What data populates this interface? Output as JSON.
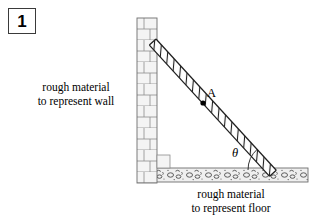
{
  "figure": {
    "number_label": "1",
    "scene": "ladder-against-wall",
    "wall_caption": {
      "line1": "rough material",
      "line2": "to represent wall"
    },
    "floor_caption": {
      "line1": "rough material",
      "line2": "to represent floor"
    },
    "point_label": "A",
    "angle_label": "θ",
    "colors": {
      "ink": "#000000",
      "outline": "#3a3a3a",
      "brick_fill": "#f2f2f2",
      "brick_line": "#8a8a8a",
      "floor_fill": "#ededed",
      "floor_line": "#7a7a7a",
      "ladder_line": "#2b2b2b",
      "background": "#ffffff"
    },
    "geometry": {
      "wall_x": 137,
      "wall_top_y": 18,
      "wall_bottom_y": 183,
      "wall_width": 20,
      "floor_left_x": 147,
      "floor_right_x": 308,
      "floor_top_y": 168,
      "floor_bottom_y": 182,
      "ladder_top": [
        156,
        39
      ],
      "ladder_bottom": [
        276,
        170
      ],
      "point_A": [
        203,
        103
      ],
      "angle_vertex": [
        276,
        170
      ],
      "angle_degrees": 47
    }
  }
}
